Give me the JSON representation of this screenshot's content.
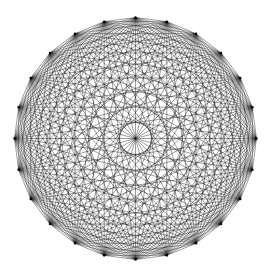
{
  "diagram": {
    "type": "complete-graph",
    "name": "K24 mystic rose",
    "vertex_count": 24,
    "center": [
      135.5,
      138.5
    ],
    "radius": 121,
    "start_angle_deg": -90,
    "edge_color": "#000000",
    "edge_width": 0.45,
    "edge_opacity": 0.85,
    "background": "#ffffff"
  }
}
